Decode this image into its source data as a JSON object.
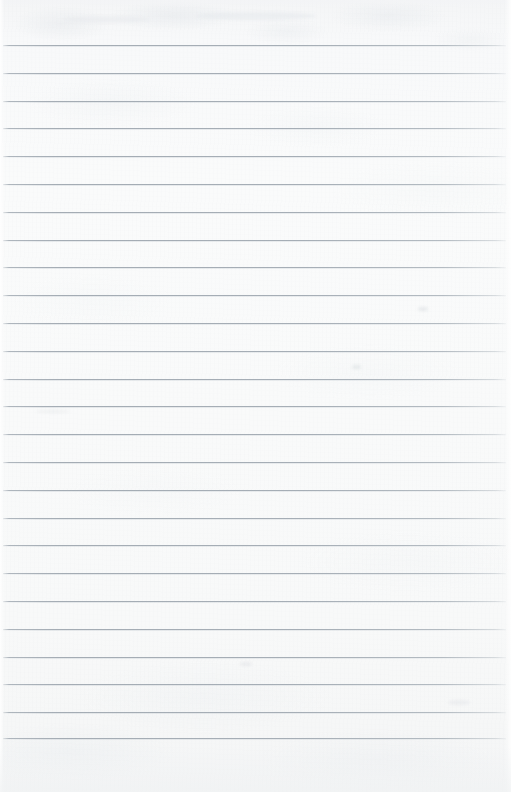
{
  "document": {
    "kind": "ruled-paper-scan",
    "description": "Blank lined notebook paper, scanned",
    "width_px": 511,
    "height_px": 792,
    "has_text": false,
    "has_handwriting": false,
    "has_margin_rule": false
  },
  "paper": {
    "background_color": "#f8f9f9",
    "background_top_color": "#f4f5f6",
    "background_mid_color": "#fafbfb",
    "background_bottom_color": "#f4f5f6",
    "texture": "subtle-mottled-fiber",
    "orientation": "portrait"
  },
  "rules": {
    "line_color": "#a6aeb6",
    "line_color_faded": "#ced4d9",
    "line_thickness_px": 1,
    "count": 26,
    "spacing_px": 27.7,
    "first_line_y": 45,
    "last_line_y": 738,
    "left_x": 3,
    "right_x": 506,
    "y_positions": [
      45,
      73,
      101,
      128,
      156,
      184,
      212,
      240,
      267,
      295,
      323,
      351,
      379,
      406,
      434,
      462,
      490,
      518,
      545,
      573,
      601,
      629,
      657,
      684,
      712,
      738
    ]
  },
  "margins": {
    "top_margin_px": 45,
    "bottom_margin_px": 54,
    "left_margin_px": 3,
    "right_margin_px": 5
  },
  "artifacts": [
    {
      "name": "smudge-upper-right",
      "x": 418,
      "y": 307,
      "w": 10,
      "h": 4,
      "color": "rgba(205,210,215,0.40)"
    },
    {
      "name": "smudge-mid-right",
      "x": 352,
      "y": 365,
      "w": 9,
      "h": 4,
      "color": "rgba(203,209,214,0.38)"
    },
    {
      "name": "smudge-mid-left",
      "x": 36,
      "y": 410,
      "w": 34,
      "h": 3,
      "color": "rgba(214,219,223,0.30)"
    },
    {
      "name": "smudge-lower-mid",
      "x": 240,
      "y": 662,
      "w": 12,
      "h": 4,
      "color": "rgba(208,213,218,0.32)"
    },
    {
      "name": "smudge-lower-right",
      "x": 448,
      "y": 700,
      "w": 22,
      "h": 5,
      "color": "rgba(212,217,221,0.28)"
    },
    {
      "name": "smudge-top-band",
      "x": 64,
      "y": 16,
      "w": 86,
      "h": 7,
      "color": "rgba(231,234,237,0.55)"
    },
    {
      "name": "smudge-top-band-2",
      "x": 196,
      "y": 12,
      "w": 120,
      "h": 8,
      "color": "rgba(228,232,235,0.50)"
    }
  ]
}
